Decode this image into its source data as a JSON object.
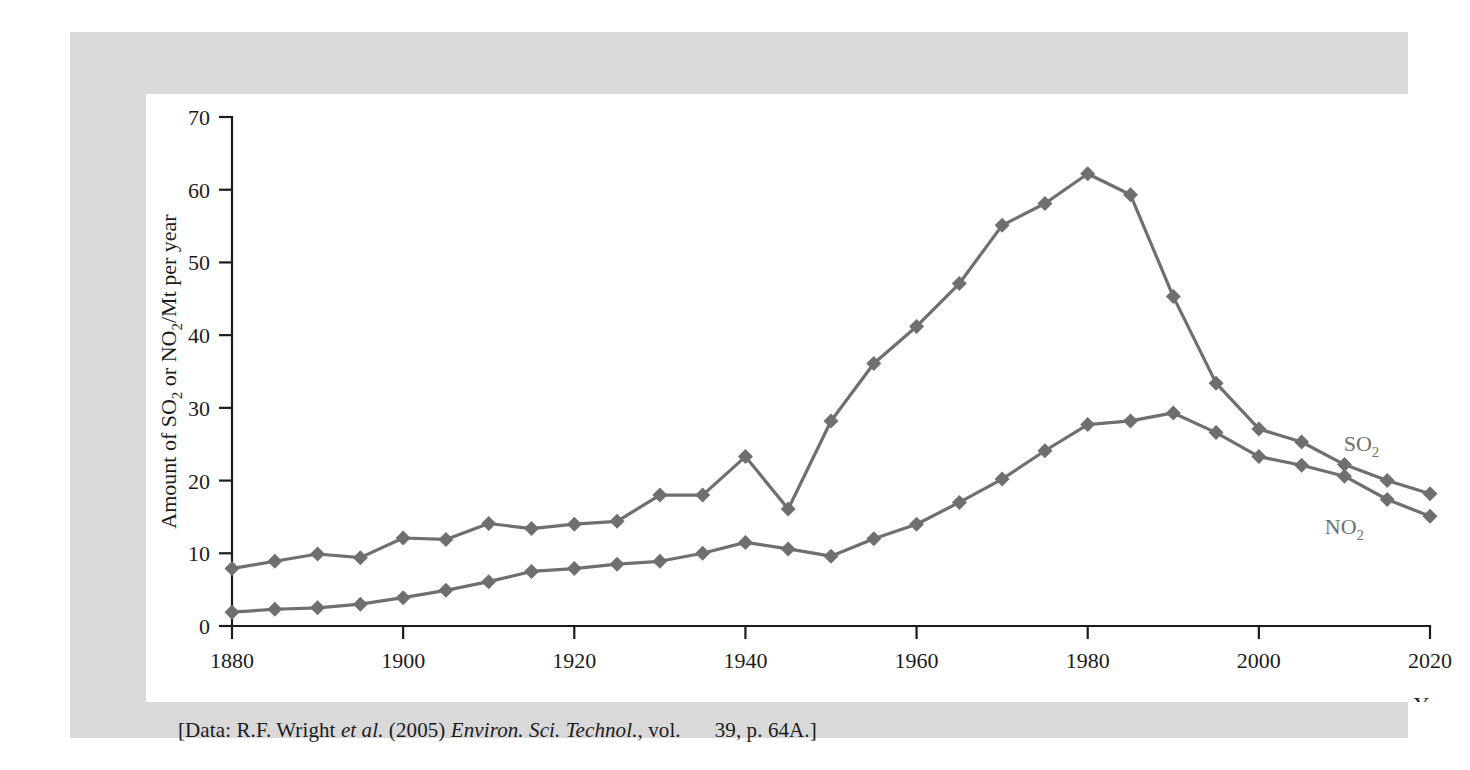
{
  "figure": {
    "caption_prefix": "[Data: R.F. Wright ",
    "caption_italic1": "et al.",
    "caption_mid1": " (2005) ",
    "caption_italic2": "Environ. Sci. Technol.",
    "caption_mid2": ", vol.",
    "caption_suffix": "39, p. 64A.]",
    "panel_color": "#d9d9d9",
    "plot_background": "#ffffff"
  },
  "chart_data": {
    "type": "line",
    "title": "",
    "subtitle": "",
    "xlabel": "Year",
    "ylabel": "Amount of SO2 or NO2/Mt per year",
    "ylabel_parts": [
      "Amount of SO",
      "2",
      " or NO",
      "2",
      "/Mt per year"
    ],
    "xlim": [
      1880,
      2020
    ],
    "ylim": [
      0,
      70
    ],
    "grid": false,
    "legend_position": "inline-right",
    "xticks": [
      1880,
      1900,
      1920,
      1940,
      1960,
      1980,
      2000,
      2020
    ],
    "xtick_labels": [
      "1880",
      "1900",
      "1920",
      "1940",
      "1960",
      "1980",
      "2000",
      "2020"
    ],
    "yticks": [
      0,
      10,
      20,
      30,
      40,
      50,
      60,
      70
    ],
    "ytick_labels": [
      "0",
      "10",
      "20",
      "30",
      "40",
      "50",
      "60",
      "70"
    ],
    "x": [
      1880,
      1885,
      1890,
      1895,
      1900,
      1905,
      1910,
      1915,
      1920,
      1925,
      1930,
      1935,
      1940,
      1945,
      1950,
      1955,
      1960,
      1965,
      1970,
      1975,
      1980,
      1985,
      1990,
      1995,
      2000,
      2005,
      2010,
      2015,
      2020
    ],
    "series": [
      {
        "name": "SO2",
        "label_parts": [
          "SO",
          "2"
        ],
        "color": "#6f6f6f",
        "marker": "diamond",
        "values": [
          7.9,
          8.9,
          9.9,
          9.4,
          12.1,
          11.9,
          14.1,
          13.4,
          14.0,
          14.4,
          18.0,
          18.0,
          23.3,
          16.1,
          28.2,
          36.1,
          41.2,
          47.1,
          55.1,
          58.1,
          62.2,
          59.3,
          45.3,
          33.4,
          27.1,
          25.3,
          22.2,
          20.0,
          18.2
        ]
      },
      {
        "name": "NO2",
        "label_parts": [
          "NO",
          "2"
        ],
        "color": "#6f6f6f",
        "marker": "diamond",
        "values": [
          1.9,
          2.3,
          2.5,
          3.0,
          3.9,
          4.9,
          6.1,
          7.5,
          7.9,
          8.5,
          8.9,
          10.0,
          11.5,
          10.6,
          9.6,
          12.0,
          14.0,
          17.0,
          20.2,
          24.1,
          27.7,
          28.2,
          29.3,
          26.6,
          23.3,
          22.1,
          20.6,
          17.4,
          15.1
        ]
      }
    ],
    "annotations": [
      {
        "text": "SO2",
        "x": 2012,
        "y": 24.0
      },
      {
        "text": "NO2",
        "x": 2010,
        "y": 12.6
      }
    ]
  }
}
